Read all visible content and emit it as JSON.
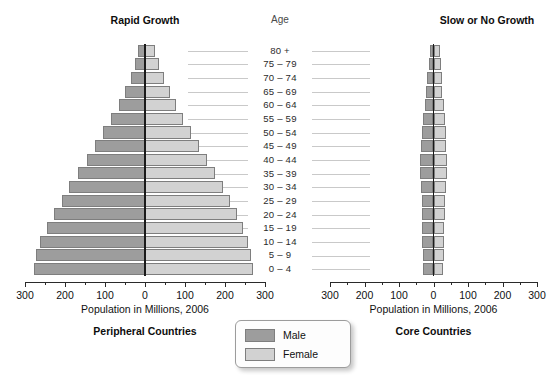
{
  "headings": {
    "left": "Rapid Growth",
    "right": "Slow or No Growth",
    "age": "Age"
  },
  "captions": {
    "axis_left": "Population in Millions, 2006",
    "axis_right": "Population in Millions, 2006",
    "panel_left": "Peripheral Countries",
    "panel_right": "Core Countries"
  },
  "legend": {
    "male_label": "Male",
    "female_label": "Female",
    "male_color": "#9d9d9d",
    "female_color": "#d2d2d2"
  },
  "chart_data": {
    "type": "bar",
    "subtype": "population-pyramid",
    "xlabel": "Population in Millions, 2006",
    "ylabel": "Age",
    "xlim": [
      -300,
      300
    ],
    "xticks": [
      300,
      200,
      100,
      0,
      100,
      200,
      300
    ],
    "xtick_labels": [
      "300",
      "200",
      "100",
      "0",
      "100",
      "200",
      "300"
    ],
    "minor_tick_step": 50,
    "grid": false,
    "legend_position": "bottom-center",
    "categories": [
      "80 +",
      "75 – 79",
      "70 – 74",
      "65 – 69",
      "60 – 64",
      "55 – 59",
      "50 – 54",
      "45 – 49",
      "40 – 44",
      "35 – 39",
      "30 – 34",
      "25 – 29",
      "20 – 24",
      "15 – 19",
      "10 – 14",
      "5 – 9",
      "0 – 4"
    ],
    "panels": [
      {
        "name": "Peripheral Countries",
        "heading": "Rapid Growth",
        "series": [
          {
            "name": "Male",
            "color": "#9d9d9d",
            "values": [
              18,
              26,
              36,
              50,
              66,
              84,
              104,
              124,
              146,
              168,
              190,
              208,
              228,
              244,
              262,
              272,
              278
            ]
          },
          {
            "name": "Female",
            "color": "#d2d2d2",
            "values": [
              26,
              36,
              48,
              62,
              78,
              96,
              114,
              134,
              154,
              176,
              196,
              212,
              230,
              244,
              258,
              266,
              270
            ]
          }
        ]
      },
      {
        "name": "Core Countries",
        "heading": "Slow or No Growth",
        "series": [
          {
            "name": "Male",
            "color": "#9d9d9d",
            "values": [
              10,
              14,
              18,
              22,
              26,
              30,
              34,
              36,
              38,
              38,
              36,
              34,
              33,
              33,
              32,
              30,
              29
            ]
          },
          {
            "name": "Female",
            "color": "#d2d2d2",
            "values": [
              20,
              22,
              24,
              26,
              29,
              32,
              35,
              37,
              38,
              38,
              36,
              34,
              32,
              31,
              30,
              29,
              28
            ]
          }
        ]
      }
    ]
  }
}
